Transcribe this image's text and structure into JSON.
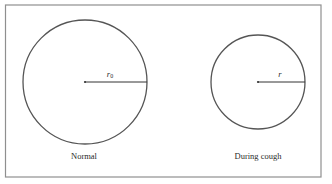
{
  "figure": {
    "frame": {
      "x": 5,
      "y": 5,
      "width": 316,
      "height": 172,
      "stroke": "#8a8a8a"
    },
    "circles": [
      {
        "id": "normal",
        "caption": "Normal",
        "radius_label": "r",
        "radius_subscript": "0",
        "cx": 85,
        "cy": 82,
        "r": 62,
        "stroke": "#555555"
      },
      {
        "id": "during-cough",
        "caption": "During cough",
        "radius_label": "r",
        "radius_subscript": "",
        "cx": 258,
        "cy": 82,
        "r": 47,
        "stroke": "#555555"
      }
    ]
  }
}
